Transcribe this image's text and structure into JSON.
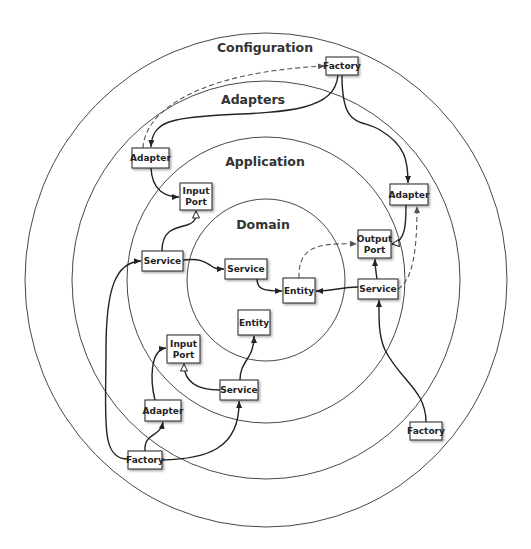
{
  "rings": [
    {
      "id": "configuration",
      "label": "Configuration",
      "rx": 241,
      "ry": 247
    },
    {
      "id": "adapters",
      "label": "Adapters",
      "rx": 194,
      "ry": 199
    },
    {
      "id": "application",
      "label": "Application",
      "rx": 139,
      "ry": 143
    },
    {
      "id": "domain",
      "label": "Domain",
      "rx": 79,
      "ry": 81
    }
  ],
  "center": {
    "x": 266,
    "y": 280
  },
  "boxes": [
    {
      "id": "factory-top",
      "lines": [
        "Factory"
      ],
      "x": 326,
      "y": 57,
      "w": 32,
      "h": 18
    },
    {
      "id": "adapter-left",
      "lines": [
        "Adapter"
      ],
      "x": 132,
      "y": 148,
      "w": 37,
      "h": 20
    },
    {
      "id": "adapter-right",
      "lines": [
        "Adapter"
      ],
      "x": 390,
      "y": 184,
      "w": 38,
      "h": 21
    },
    {
      "id": "input-port-top",
      "lines": [
        "Input",
        "Port"
      ],
      "x": 180,
      "y": 183,
      "w": 32,
      "h": 27
    },
    {
      "id": "service-app-left",
      "lines": [
        "Service"
      ],
      "x": 142,
      "y": 251,
      "w": 41,
      "h": 20
    },
    {
      "id": "service-domain",
      "lines": [
        "Service"
      ],
      "x": 225,
      "y": 259,
      "w": 42,
      "h": 20
    },
    {
      "id": "output-port",
      "lines": [
        "Output",
        "Port"
      ],
      "x": 358,
      "y": 230,
      "w": 33,
      "h": 28
    },
    {
      "id": "entity-center",
      "lines": [
        "Entity"
      ],
      "x": 283,
      "y": 278,
      "w": 32,
      "h": 25
    },
    {
      "id": "service-app-right",
      "lines": [
        "Service"
      ],
      "x": 358,
      "y": 279,
      "w": 40,
      "h": 20
    },
    {
      "id": "entity-bottom",
      "lines": [
        "Entity"
      ],
      "x": 238,
      "y": 310,
      "w": 32,
      "h": 25
    },
    {
      "id": "input-port-bottom",
      "lines": [
        "Input",
        "Port"
      ],
      "x": 167,
      "y": 335,
      "w": 33,
      "h": 28
    },
    {
      "id": "service-app-bottom",
      "lines": [
        "Service"
      ],
      "x": 220,
      "y": 380,
      "w": 38,
      "h": 20
    },
    {
      "id": "adapter-bottom",
      "lines": [
        "Adapter"
      ],
      "x": 145,
      "y": 400,
      "w": 36,
      "h": 21
    },
    {
      "id": "factory-bottom-left",
      "lines": [
        "Factory"
      ],
      "x": 128,
      "y": 451,
      "w": 34,
      "h": 18
    },
    {
      "id": "factory-bottom-right",
      "lines": [
        "Factory"
      ],
      "x": 410,
      "y": 422,
      "w": 32,
      "h": 18
    }
  ]
}
